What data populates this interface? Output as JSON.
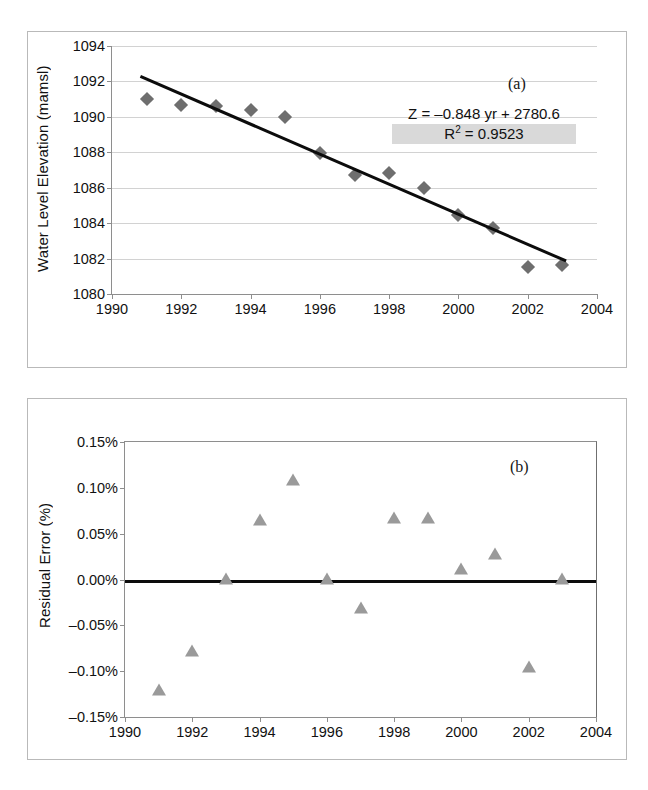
{
  "figure": {
    "panel_a_tag": "(a)",
    "panel_b_tag": "(b)",
    "equation_line1": "Z  = –0.848 yr + 2780.6",
    "equation_r2_prefix": "R",
    "equation_r2_sup": "2",
    "equation_r2_value": " = 0.9523"
  },
  "chart_data": [
    {
      "type": "scatter",
      "panel": "(a)",
      "title": "",
      "xlabel": "",
      "ylabel": "Water Level Elevation (mamsl)",
      "xlim": [
        1990,
        2004
      ],
      "ylim": [
        1080,
        1094
      ],
      "xticks": [
        1990,
        1992,
        1994,
        1996,
        1998,
        2000,
        2002,
        2004
      ],
      "xtick_labels": [
        "1990",
        "1992",
        "1994",
        "1996",
        "1998",
        "2000",
        "2002",
        "2004"
      ],
      "yticks": [
        1080,
        1082,
        1084,
        1086,
        1088,
        1090,
        1092,
        1094
      ],
      "ytick_labels": [
        "1080",
        "1082",
        "1084",
        "1086",
        "1088",
        "1090",
        "1092",
        "1094"
      ],
      "grid": "horizontal",
      "legend": "none",
      "marker": "diamond",
      "marker_color": "#6e6e6e",
      "x": [
        1991,
        1992,
        1993,
        1994,
        1995,
        1996,
        1997,
        1998,
        1999,
        2000,
        2001,
        2002,
        2003
      ],
      "values": [
        1091.0,
        1090.65,
        1090.6,
        1090.4,
        1090.0,
        1087.95,
        1086.7,
        1086.85,
        1086.0,
        1084.45,
        1083.75,
        1081.5,
        1081.65
      ],
      "trendline": {
        "label": "Z = –0.848 yr + 2780.6",
        "slope": -0.848,
        "intercept": 2780.6,
        "r_squared": 0.9523,
        "x_start": 1990.85,
        "x_end": 2003.15,
        "color": "#0c0c0c"
      }
    },
    {
      "type": "scatter",
      "panel": "(b)",
      "title": "",
      "xlabel": "",
      "ylabel": "Residual Error (%)",
      "xlim": [
        1990,
        2004
      ],
      "ylim": [
        -0.15,
        0.15
      ],
      "xticks": [
        1990,
        1992,
        1994,
        1996,
        1998,
        2000,
        2002,
        2004
      ],
      "xtick_labels": [
        "1990",
        "1992",
        "1994",
        "1996",
        "1998",
        "2000",
        "2002",
        "2004"
      ],
      "yticks": [
        -0.15,
        -0.1,
        -0.05,
        0.0,
        0.05,
        0.1,
        0.15
      ],
      "ytick_labels": [
        "–0.15%",
        "–0.10%",
        "–0.05%",
        "0.00%",
        "0.05%",
        "0.10%",
        "0.15%"
      ],
      "grid": "none",
      "legend": "none",
      "marker": "triangle",
      "marker_color": "#9a9a9a",
      "x": [
        1991,
        1992,
        1993,
        1994,
        1995,
        1996,
        1997,
        1998,
        1999,
        2000,
        2001,
        2002,
        2003
      ],
      "values": [
        -0.122,
        -0.079,
        0.0,
        0.064,
        0.108,
        0.0,
        -0.032,
        0.066,
        0.066,
        0.01,
        0.027,
        -0.096,
        0.0
      ],
      "zeroline": {
        "y": 0.0,
        "color": "#0c0c0c"
      }
    }
  ]
}
